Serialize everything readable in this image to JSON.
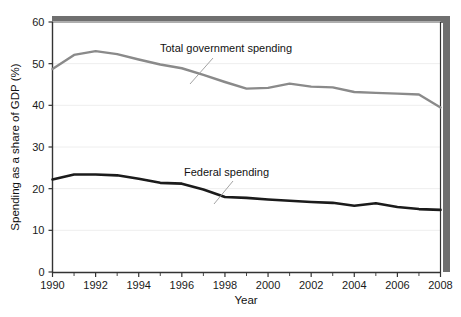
{
  "chart_data": {
    "type": "line",
    "title": "",
    "xlabel": "Year",
    "ylabel": "Spending as a share of GDP (%)",
    "xlim": [
      1990,
      2008
    ],
    "ylim": [
      0,
      60
    ],
    "ytick_labels": [
      "0",
      "10",
      "20",
      "30",
      "40",
      "50",
      "60"
    ],
    "ytick_values": [
      0,
      10,
      20,
      30,
      40,
      50,
      60
    ],
    "xtick_labels": [
      "1990",
      "1992",
      "1994",
      "1996",
      "1998",
      "2000",
      "2002",
      "2004",
      "2006",
      "2008"
    ],
    "xtick_values": [
      1990,
      1992,
      1994,
      1996,
      1998,
      2000,
      2002,
      2004,
      2006,
      2008
    ],
    "minor_xticks": [
      1990,
      1991,
      1992,
      1993,
      1994,
      1995,
      1996,
      1997,
      1998,
      1999,
      2000,
      2001,
      2002,
      2003,
      2004,
      2005,
      2006,
      2007,
      2008
    ],
    "grid": "horizontal",
    "legend_position": "inline-annotations",
    "x": [
      1990,
      1991,
      1992,
      1993,
      1994,
      1995,
      1996,
      1997,
      1998,
      1999,
      2000,
      2001,
      2002,
      2003,
      2004,
      2005,
      2006,
      2007,
      2008
    ],
    "series": [
      {
        "name": "Total government spending",
        "color": "#8a8a8a",
        "values": [
          48.7,
          52.1,
          53.0,
          52.3,
          51.0,
          49.8,
          48.9,
          47.3,
          45.6,
          44.0,
          44.2,
          45.2,
          44.5,
          44.3,
          43.2,
          43.0,
          42.8,
          42.6,
          39.5
        ]
      },
      {
        "name": "Federal spending",
        "color": "#1b1b1b",
        "values": [
          22.2,
          23.4,
          23.4,
          23.2,
          22.4,
          21.4,
          21.2,
          19.8,
          18.0,
          17.8,
          17.4,
          17.1,
          16.8,
          16.6,
          15.9,
          16.5,
          15.6,
          15.1,
          14.9
        ]
      }
    ],
    "annotations": [
      {
        "text": "Total government spending",
        "x": 1997.3,
        "y": 51.5
      },
      {
        "text": "Federal spending",
        "x": 1998.6,
        "y": 24.0
      }
    ]
  },
  "figure": {
    "frame_shadow_color": "#6f6f6f",
    "axis_color": "#333333",
    "grid_color": "#eeeeee",
    "background": "#ffffff"
  }
}
